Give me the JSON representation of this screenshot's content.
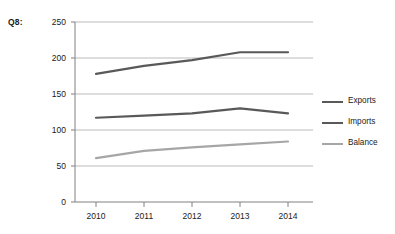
{
  "question_label": "Q8:",
  "chart_data": {
    "type": "line",
    "title": "",
    "subtitle": "",
    "xlabel": "",
    "ylabel": "",
    "categories": [
      "2010",
      "2011",
      "2012",
      "2013",
      "2014"
    ],
    "series": [
      {
        "name": "Exports",
        "values": [
          178,
          189,
          197,
          208,
          208
        ],
        "color": "#595959"
      },
      {
        "name": "Imports",
        "values": [
          117,
          120,
          123,
          130,
          123
        ],
        "color": "#595959"
      },
      {
        "name": "Balance",
        "values": [
          61,
          71,
          76,
          80,
          84
        ],
        "color": "#a6a6a6"
      }
    ],
    "ylim": [
      0,
      250
    ],
    "yticks": [
      0,
      50,
      100,
      150,
      200,
      250
    ],
    "ytick_labels": [
      "0",
      "50",
      "100",
      "150",
      "200",
      "250"
    ],
    "xtick_labels": [
      "2010",
      "2011",
      "2012",
      "2013",
      "2014"
    ],
    "grid": "horizontal",
    "legend_position": "right",
    "legend_entries": [
      "Exports",
      "Imports",
      "Balance"
    ],
    "background_color": "#ffffff",
    "axis_color": "#808080",
    "gridline_color": "#a9a9a9"
  },
  "legend": {
    "items": [
      {
        "label": "Exports"
      },
      {
        "label": "Imports"
      },
      {
        "label": "Balance"
      }
    ]
  },
  "axes": {
    "y_tick_labels": [
      "250",
      "200",
      "150",
      "100",
      "50",
      "0"
    ],
    "x_tick_labels": [
      "2010",
      "2011",
      "2012",
      "2013",
      "2014"
    ]
  }
}
